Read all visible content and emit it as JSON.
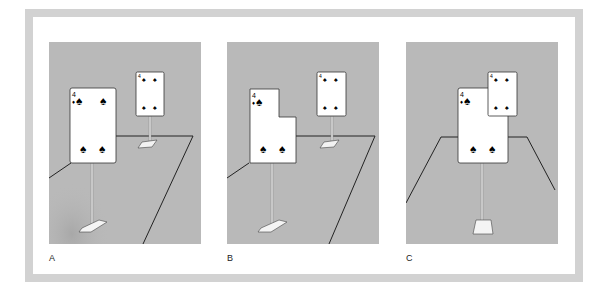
{
  "figure": {
    "colors": {
      "frame": "#d2d2d2",
      "panel_bg": "#b9b9b9",
      "card": "#ffffff",
      "line": "#222222"
    },
    "panels": [
      {
        "label": "A",
        "front_card": {
          "rank": "4",
          "suit": "spade"
        },
        "back_card": {
          "rank": "4",
          "suit": "spade"
        }
      },
      {
        "label": "B",
        "front_card": {
          "rank": "4",
          "suit": "spade",
          "notched": true
        },
        "back_card": {
          "rank": "4",
          "suit": "spade"
        }
      },
      {
        "label": "C",
        "front_card": {
          "rank": "4",
          "suit": "spade"
        },
        "back_card": {
          "rank": "4",
          "suit": "spade",
          "appears_in_front": true
        }
      }
    ]
  }
}
